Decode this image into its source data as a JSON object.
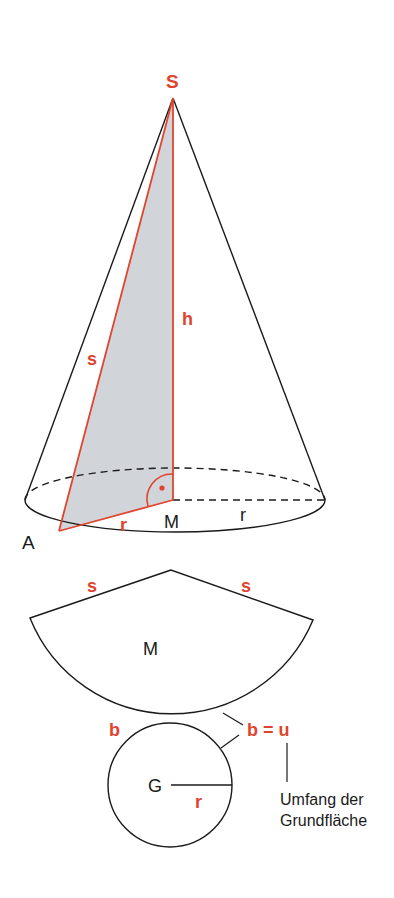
{
  "diagram": {
    "colors": {
      "accent": "#e0442e",
      "line": "#1a1a1a",
      "shade": "#c9ced4"
    },
    "cone": {
      "apex_label": "S",
      "slant_label": "s",
      "height_label": "h",
      "radius_label_red": "r",
      "radius_label_black": "r",
      "center_label": "M",
      "point_label": "A"
    },
    "net": {
      "sector_label": "M",
      "slant_left_label": "s",
      "slant_right_label": "s",
      "arc_label": "b",
      "equation_label": "b = u",
      "base_label": "G",
      "base_radius_label": "r",
      "annotation_line1": "Umfang der",
      "annotation_line2": "Grundfläche"
    }
  }
}
